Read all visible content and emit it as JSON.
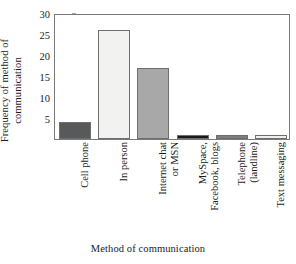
{
  "chart_data": {
    "type": "bar",
    "title": "",
    "xlabel": "Method of communication",
    "ylabel": "Frequency of method of\ncommunication",
    "categories": [
      "Cell phone",
      "In person",
      "Internet chat\nor MSN",
      "MySpace,\nFacebook, blogs",
      "Telephone\n(landline)",
      "Text messaging"
    ],
    "values": [
      4,
      26,
      17,
      1,
      1,
      1
    ],
    "ylim": [
      0,
      30
    ],
    "yticks": [
      0,
      5,
      10,
      15,
      20,
      25,
      30
    ],
    "ytick_labels": [
      "",
      "5",
      "10",
      "15",
      "20",
      "25",
      "30"
    ],
    "grid": false,
    "legend": "none",
    "bar_colors": [
      "#58595b",
      "#f2f2f0",
      "#a8a8a8",
      "#1a1a1a",
      "#7e7e7e",
      "#efefed"
    ],
    "bar_edge_color": "#6e6e6e",
    "axis_color": "#7a7a7a",
    "background": "#ffffff"
  }
}
